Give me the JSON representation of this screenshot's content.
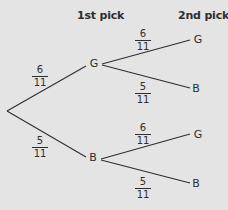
{
  "headers": {
    "first": "1st pick",
    "second": "2nd pick"
  },
  "colors": {
    "background": "#e4e4e4",
    "ink": "#2e2e2e"
  },
  "tree": {
    "first_pick": [
      {
        "label": "G",
        "probability": {
          "num": "6",
          "den": "11"
        }
      },
      {
        "label": "B",
        "probability": {
          "num": "5",
          "den": "11"
        }
      }
    ],
    "second_pick": {
      "after_G": [
        {
          "label": "G",
          "probability": {
            "num": "6",
            "den": "11"
          }
        },
        {
          "label": "B",
          "probability": {
            "num": "5",
            "den": "11"
          }
        }
      ],
      "after_B": [
        {
          "label": "G",
          "probability": {
            "num": "6",
            "den": "11"
          }
        },
        {
          "label": "B",
          "probability": {
            "num": "5",
            "den": "11"
          }
        }
      ]
    }
  }
}
